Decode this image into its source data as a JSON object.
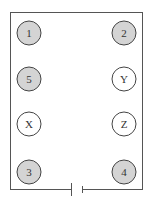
{
  "diagram": {
    "type": "circuit",
    "wire_color": "#555555",
    "bulbs": [
      {
        "label": "1",
        "cx": 29,
        "cy": 33,
        "lit": true
      },
      {
        "label": "2",
        "cx": 124,
        "cy": 33,
        "lit": true
      },
      {
        "label": "5",
        "cx": 29,
        "cy": 79,
        "lit": true
      },
      {
        "label": "Y",
        "cx": 124,
        "cy": 79,
        "lit": false
      },
      {
        "label": "X",
        "cx": 29,
        "cy": 124,
        "lit": false
      },
      {
        "label": "Z",
        "cx": 124,
        "cy": 124,
        "lit": false
      },
      {
        "label": "3",
        "cx": 29,
        "cy": 172,
        "lit": true
      },
      {
        "label": "4",
        "cx": 124,
        "cy": 172,
        "lit": true
      }
    ],
    "lit_fill": "#d4d4d4",
    "unlit_fill": "#ffffff",
    "battery": {
      "symbol": "cell"
    }
  }
}
